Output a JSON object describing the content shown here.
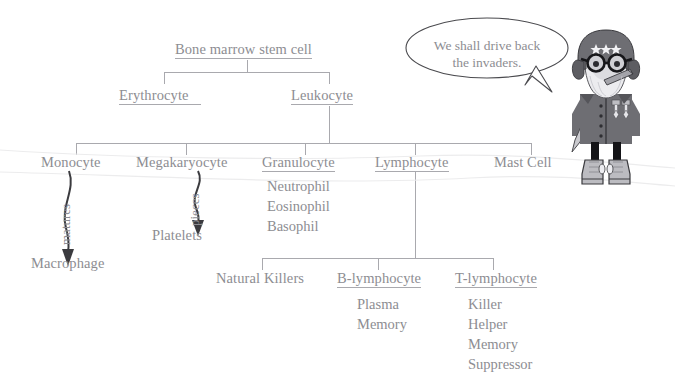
{
  "diagram": {
    "title_node": {
      "label": "Bone marrow stem cell",
      "underlined": true
    },
    "level2": [
      {
        "label": "Erythrocyte",
        "underlined": true
      },
      {
        "label": "Leukocyte",
        "underlined": true
      }
    ],
    "level3": [
      {
        "label": "Monocyte",
        "underlined": false
      },
      {
        "label": "Megakaryocyte",
        "underlined": false
      },
      {
        "label": "Granulocyte",
        "underlined": true
      },
      {
        "label": "Lymphocyte",
        "underlined": true
      },
      {
        "label": "Mast Cell",
        "underlined": false
      }
    ],
    "granulocyte_types": [
      "Neutrophil",
      "Eosinophil",
      "Basophil"
    ],
    "lymphocyte_children": [
      {
        "label": "Natural Killers",
        "underlined": false
      },
      {
        "label": "B-lymphocyte",
        "underlined": true
      },
      {
        "label": "T-lymphocyte",
        "underlined": true
      }
    ],
    "b_lymphocyte_types": [
      "Plasma",
      "Memory"
    ],
    "t_lymphocyte_types": [
      "Killer",
      "Helper",
      "Memory",
      "Suppressor"
    ],
    "arrows": [
      {
        "label": "matures",
        "from": "Monocyte",
        "to": "Macrophage"
      },
      {
        "label": "pieces",
        "from": "Megakaryocyte",
        "to": "Platelets"
      }
    ],
    "terminal_nodes": [
      {
        "label": "Macrophage"
      },
      {
        "label": "Platelets"
      }
    ]
  },
  "speech_bubble": {
    "line1": "We shall drive back",
    "line2": "the invaders."
  },
  "character": {
    "name": "cartoon-general",
    "helmet_stars": 3,
    "colors": {
      "helmet": "#6e6e73",
      "coat": "#6e6e73",
      "beard": "#e9e9ec",
      "skin": "#d9d9dd",
      "boot": "#b9b9be",
      "line": "#3a3a3e"
    }
  },
  "colors": {
    "text": "#8d8d92",
    "connector": "#a9a9ae",
    "arrow": "#3b3b3f",
    "watermark": "#ebebed",
    "background": "#ffffff"
  }
}
